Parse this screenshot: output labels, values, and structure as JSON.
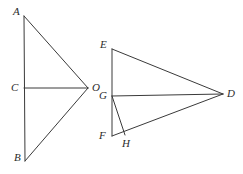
{
  "figure": {
    "background_color": "#ffffff",
    "stroke_color": "#3a3a3a",
    "stroke_width": 1,
    "label_color": "#2b2b2b",
    "left_figure": {
      "name": "triangle-ABO-with-cevian-CO",
      "vertices": {
        "A": {
          "label": "A",
          "x": 24,
          "y": 16,
          "label_x": 13,
          "label_y": 6
        },
        "B": {
          "label": "B",
          "x": 25,
          "y": 161,
          "label_x": 14,
          "label_y": 152
        },
        "C": {
          "label": "C",
          "x": 24,
          "y": 88,
          "label_x": 11,
          "label_y": 82
        },
        "O": {
          "label": "O",
          "x": 88,
          "y": 88,
          "label_x": 92,
          "label_y": 82
        }
      },
      "segments": [
        {
          "name": "segment-AB",
          "from": "A",
          "to": "B"
        },
        {
          "name": "segment-AO",
          "from": "A",
          "to": "O"
        },
        {
          "name": "segment-CO",
          "from": "C",
          "to": "O"
        },
        {
          "name": "segment-OB",
          "from": "O",
          "to": "B"
        }
      ]
    },
    "right_figure": {
      "name": "triangle-EFD-with-cevians-GD-GH",
      "vertices": {
        "E": {
          "label": "E",
          "x": 112,
          "y": 49,
          "label_x": 100,
          "label_y": 39
        },
        "F": {
          "label": "F",
          "x": 112,
          "y": 136,
          "label_x": 99,
          "label_y": 130
        },
        "G": {
          "label": "G",
          "x": 112,
          "y": 96,
          "label_x": 99,
          "label_y": 90
        },
        "H": {
          "label": "H",
          "x": 125,
          "y": 135,
          "label_x": 122,
          "label_y": 138
        },
        "D": {
          "label": "D",
          "x": 223,
          "y": 94,
          "label_x": 227,
          "label_y": 88
        }
      },
      "segments": [
        {
          "name": "segment-EF",
          "from": "E",
          "to": "F"
        },
        {
          "name": "segment-ED",
          "from": "E",
          "to": "D"
        },
        {
          "name": "segment-GD",
          "from": "G",
          "to": "D"
        },
        {
          "name": "segment-FD",
          "from": "F",
          "to": "D"
        },
        {
          "name": "segment-GH",
          "from": "G",
          "to": "H"
        }
      ]
    }
  }
}
